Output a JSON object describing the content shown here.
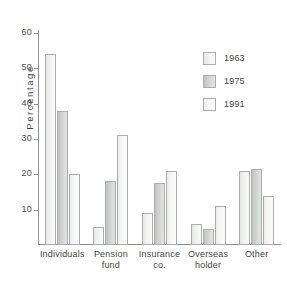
{
  "chart_data": {
    "type": "bar",
    "title": "",
    "subtitle": "",
    "xlabel": "",
    "ylabel": "Percentage",
    "ylim": [
      0,
      60
    ],
    "yticks": [
      10,
      20,
      30,
      40,
      50,
      60
    ],
    "ytick_labels": [
      "10",
      "20",
      "30",
      "40",
      "50",
      "60"
    ],
    "grid": false,
    "legend_position": "upper-right",
    "categories": [
      "Individuals",
      "Pension\nfund",
      "Insurance\nco.",
      "Overseas\nholder",
      "Other"
    ],
    "series": [
      {
        "name": "1963",
        "color": "#f2f2f0",
        "values": [
          54,
          5,
          9,
          6,
          21
        ]
      },
      {
        "name": "1975",
        "color": "#d2d4d2",
        "values": [
          38,
          18,
          17.5,
          4.5,
          21.5
        ]
      },
      {
        "name": "1991",
        "color": "#f6f6f4",
        "values": [
          20,
          31,
          21,
          11,
          14
        ]
      }
    ],
    "annotations": []
  },
  "legend": {
    "items": [
      {
        "label": "1963"
      },
      {
        "label": "1975"
      },
      {
        "label": "1991"
      }
    ]
  },
  "axes": {
    "y_title": "Percentage"
  },
  "colors": {
    "axis": "#8b8f92",
    "text": "#3f3f3f",
    "background": "#ffffff",
    "bar_border": "#a9adb0"
  }
}
